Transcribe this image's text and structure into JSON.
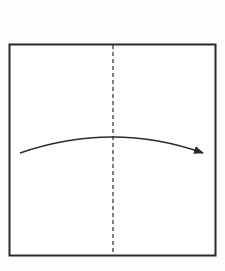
{
  "diagram": {
    "type": "origami-fold-step",
    "paper": {
      "x": 9,
      "y": 44,
      "width": 207,
      "height": 212,
      "stroke": "#2a2a2a",
      "fill": "#ffffff"
    },
    "fold_line": {
      "style": "dashed",
      "x": 113,
      "y1": 44,
      "y2": 256,
      "stroke": "#3a3a3a"
    },
    "arrow": {
      "start": [
        20,
        153
      ],
      "control": [
        113,
        121
      ],
      "end": [
        204,
        153
      ],
      "direction": "left-to-right",
      "stroke": "#2a2a2a"
    }
  }
}
